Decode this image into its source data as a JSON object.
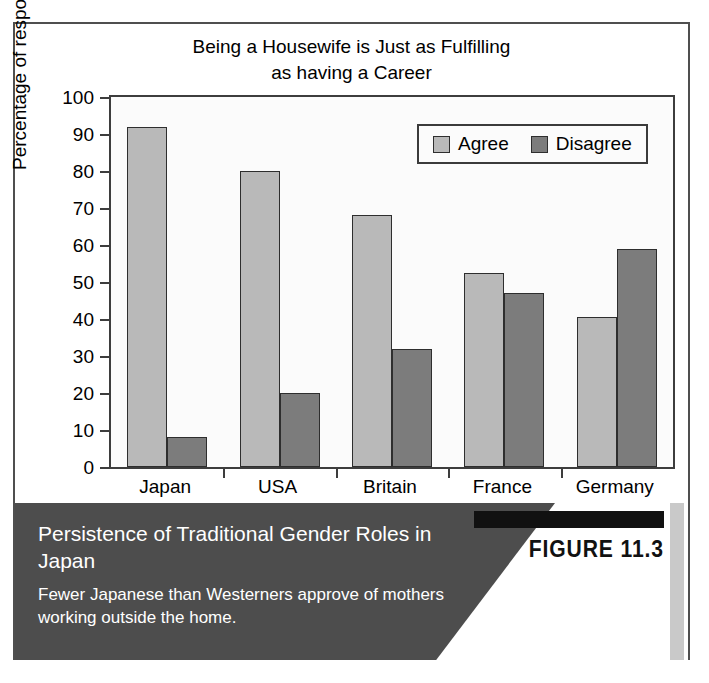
{
  "chart_data": {
    "type": "bar",
    "title": "Being a Housewife is Just as Fulfilling\nas having a Career",
    "xlabel": "",
    "ylabel": "Percentage of respondents",
    "ylim": [
      0,
      100
    ],
    "ytick_step": 10,
    "yticks": [
      100,
      90,
      80,
      70,
      60,
      50,
      40,
      30,
      20,
      10,
      0
    ],
    "grid": false,
    "legend_position": "top-right-inside",
    "categories": [
      "Japan",
      "USA",
      "Britain",
      "France",
      "Germany"
    ],
    "series": [
      {
        "name": "Agree",
        "color": "#b9b9b9",
        "values": [
          92,
          80,
          68,
          52.5,
          40.5
        ]
      },
      {
        "name": "Disagree",
        "color": "#7c7c7c",
        "values": [
          8,
          20,
          32,
          47,
          59
        ]
      }
    ]
  },
  "caption": {
    "title": "Persistence of Traditional Gender Roles in Japan",
    "subtitle": "Fewer Japanese than Westerners approve of mothers working outside the home.",
    "figure_tag": "FIGURE 11.3"
  },
  "colors": {
    "agree": "#b9b9b9",
    "disagree": "#7c7c7c",
    "caption_band": "#4d4d4d",
    "figure_tag_bar": "#111111",
    "frame": "#4f4f4f"
  }
}
